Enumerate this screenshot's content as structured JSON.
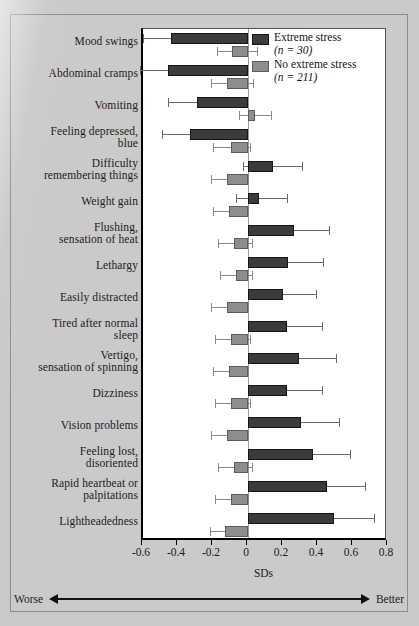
{
  "chart_data": {
    "type": "bar",
    "orientation": "horizontal",
    "title": "",
    "xlabel": "SDs",
    "ylabel": "",
    "xlim": [
      -0.6,
      0.8
    ],
    "xticks": [
      -0.6,
      -0.4,
      -0.2,
      0,
      0.2,
      0.4,
      0.6,
      0.8
    ],
    "xticklabels": [
      "-0.6",
      "-0.4",
      "-0.2",
      "0",
      "0.2",
      "0.4",
      "0.6",
      "0.8"
    ],
    "grid": false,
    "zero_line": true,
    "legend_position": "top-right",
    "axis_annotation": {
      "left": "Worse",
      "right": "Better"
    },
    "categories": [
      "Mood swings",
      "Abdominal cramps",
      "Vomiting",
      "Feeling depressed, blue",
      "Difficulty remembering things",
      "Weight gain",
      "Flushing, sensation of heat",
      "Lethargy",
      "Easily distracted",
      "Tired after normal sleep",
      "Vertigo, sensation of spinning",
      "Dizziness",
      "Vision problems",
      "Feeling lost, disoriented",
      "Rapid heartbeat or palpitations",
      "Lightheadedness"
    ],
    "series": [
      {
        "name": "Extreme stress",
        "n": 30,
        "color": "#3b3b3b",
        "values": [
          -0.44,
          -0.46,
          -0.29,
          -0.33,
          0.14,
          0.06,
          0.26,
          0.23,
          0.2,
          0.22,
          0.29,
          0.22,
          0.3,
          0.37,
          0.45,
          0.49
        ],
        "ci_low": [
          -0.6,
          -0.62,
          -0.46,
          -0.49,
          -0.03,
          -0.07,
          0.06,
          0.04,
          0.01,
          0.03,
          0.08,
          0.02,
          0.09,
          0.15,
          0.23,
          0.26
        ],
        "ci_high": [
          -0.26,
          -0.28,
          -0.12,
          -0.17,
          0.31,
          0.22,
          0.46,
          0.43,
          0.39,
          0.42,
          0.5,
          0.42,
          0.52,
          0.58,
          0.67,
          0.72
        ]
      },
      {
        "name": "No extreme stress",
        "n": 211,
        "color": "#8d8d8d",
        "values": [
          -0.09,
          -0.12,
          0.04,
          -0.1,
          -0.12,
          -0.11,
          -0.08,
          -0.07,
          -0.12,
          -0.1,
          -0.11,
          -0.1,
          -0.12,
          -0.08,
          -0.1,
          -0.13
        ],
        "ci_low": [
          -0.18,
          -0.21,
          -0.05,
          -0.2,
          -0.21,
          -0.2,
          -0.17,
          -0.16,
          -0.21,
          -0.19,
          -0.2,
          -0.19,
          -0.21,
          -0.17,
          -0.19,
          -0.22
        ],
        "ci_high": [
          0.05,
          0.03,
          0.13,
          0.01,
          0.0,
          0.0,
          0.02,
          0.02,
          0.0,
          0.01,
          0.0,
          0.01,
          0.0,
          0.02,
          0.0,
          -0.02
        ]
      }
    ]
  },
  "legend": {
    "items": [
      {
        "label": "Extreme stress",
        "n_text": "(n = 30)",
        "swatch": "dark"
      },
      {
        "label": "No extreme stress",
        "n_text": "(n = 211)",
        "swatch": "light"
      }
    ]
  },
  "axis": {
    "xlabel": "SDs",
    "worse": "Worse",
    "better": "Better"
  }
}
